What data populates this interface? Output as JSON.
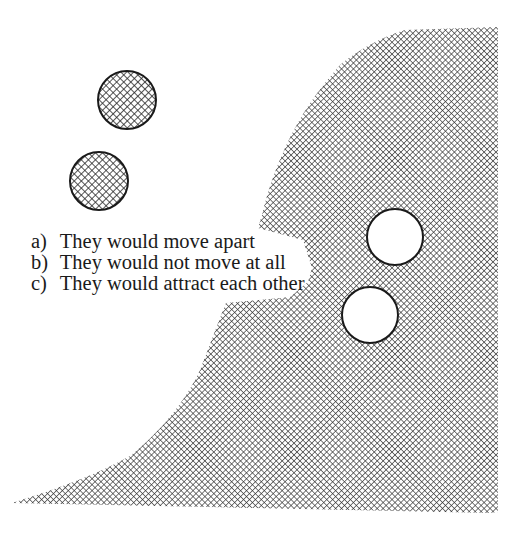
{
  "figure": {
    "hatch_color": "#2a2a2a",
    "outline_color": "#1a1a1a",
    "objects": [
      {
        "name": "hatched-sphere-upper",
        "cx": 127,
        "cy": 100,
        "r": 29
      },
      {
        "name": "hatched-sphere-lower",
        "cx": 99,
        "cy": 181,
        "r": 29
      },
      {
        "name": "white-sphere-upper",
        "cx": 395,
        "cy": 237,
        "r": 28
      },
      {
        "name": "white-sphere-lower",
        "cx": 370,
        "cy": 315,
        "r": 28
      }
    ]
  },
  "options": [
    {
      "label": "a)",
      "text": "They would move apart"
    },
    {
      "label": "b)",
      "text": "They would not move at all"
    },
    {
      "label": "c)",
      "text": "They would attract each other"
    }
  ]
}
